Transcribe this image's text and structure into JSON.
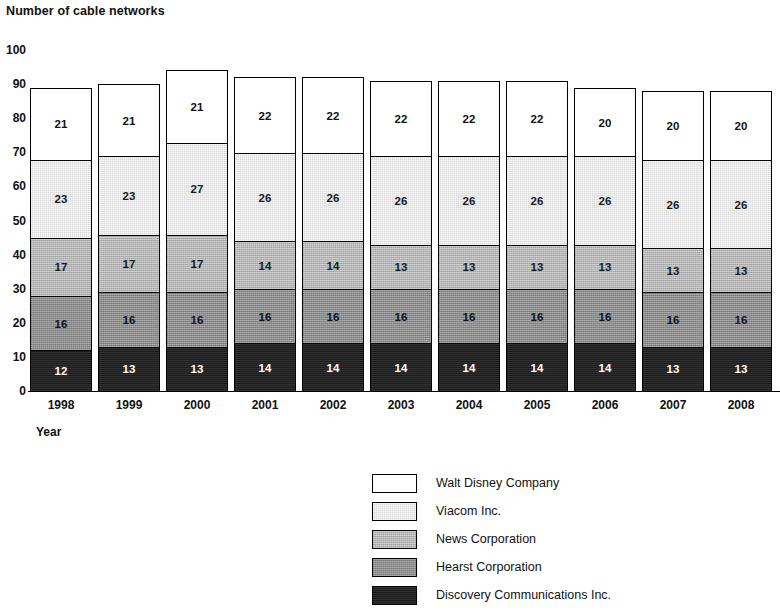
{
  "chart_data": {
    "type": "bar",
    "subtype": "stacked-bar",
    "title": "Number of cable networks",
    "ylabel": "Number of cable networks",
    "xlabel": "Year",
    "ylim": [
      0,
      100
    ],
    "ytick_labels": [
      "0",
      "10",
      "20",
      "30",
      "40",
      "50",
      "60",
      "70",
      "80",
      "90",
      "100"
    ],
    "ytick_values": [
      0,
      10,
      20,
      30,
      40,
      50,
      60,
      70,
      80,
      90,
      100
    ],
    "grid": false,
    "legend_position": "bottom-center",
    "categories": [
      "1998",
      "1999",
      "2000",
      "2001",
      "2002",
      "2003",
      "2004",
      "2005",
      "2006",
      "2007",
      "2008"
    ],
    "series": [
      {
        "name": "Discovery Communications Inc.",
        "color": "#1b1b1b",
        "values": [
          12,
          13,
          13,
          14,
          14,
          14,
          14,
          14,
          14,
          13,
          13
        ]
      },
      {
        "name": "Hearst Corporation",
        "color": "#8d8d8d",
        "values": [
          16,
          16,
          16,
          16,
          16,
          16,
          16,
          16,
          16,
          16,
          16
        ]
      },
      {
        "name": "News Corporation",
        "color": "#b3b3b3",
        "values": [
          17,
          17,
          17,
          14,
          14,
          13,
          13,
          13,
          13,
          13,
          13
        ]
      },
      {
        "name": "Viacom Inc.",
        "color": "#d9d9d9",
        "values": [
          23,
          23,
          27,
          26,
          26,
          26,
          26,
          26,
          26,
          26,
          26
        ]
      },
      {
        "name": "Walt Disney Company",
        "color": "#ffffff",
        "values": [
          21,
          21,
          21,
          22,
          22,
          22,
          22,
          22,
          20,
          20,
          20
        ]
      }
    ],
    "totals": [
      89,
      90,
      94,
      92,
      92,
      91,
      91,
      91,
      89,
      88,
      88
    ]
  },
  "legend": {
    "items": [
      {
        "label": "Walt Disney Company",
        "swatch_class": "seg-disney"
      },
      {
        "label": "Viacom Inc.",
        "swatch_class": "seg-viacom"
      },
      {
        "label": "News Corporation",
        "swatch_class": "seg-news"
      },
      {
        "label": "Hearst Corporation",
        "swatch_class": "seg-hearst"
      },
      {
        "label": "Discovery Communications Inc.",
        "swatch_class": "seg-discovery"
      }
    ]
  }
}
